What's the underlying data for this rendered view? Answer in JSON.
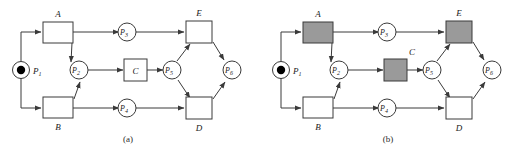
{
  "figure": {
    "type": "petri-net-diagram",
    "panels": [
      {
        "id": "a",
        "caption": "(a)",
        "description": "Petri net with all transitions unshaded",
        "places": [
          {
            "name": "P1",
            "base": "P",
            "sub": "1",
            "has_token": true,
            "label_side": "right"
          },
          {
            "name": "P2",
            "base": "P",
            "sub": "2",
            "has_token": false,
            "label_side": "inside"
          },
          {
            "name": "P3",
            "base": "P",
            "sub": "3",
            "has_token": false,
            "label_side": "inside"
          },
          {
            "name": "P4",
            "base": "P",
            "sub": "4",
            "has_token": false,
            "label_side": "inside"
          },
          {
            "name": "P5",
            "base": "P",
            "sub": "5",
            "has_token": false,
            "label_side": "inside"
          },
          {
            "name": "P6",
            "base": "P",
            "sub": "6",
            "has_token": false,
            "label_side": "inside"
          }
        ],
        "transitions": [
          {
            "name": "A",
            "label": "A",
            "shaded": false,
            "label_pos": "above"
          },
          {
            "name": "B",
            "label": "B",
            "shaded": false,
            "label_pos": "below"
          },
          {
            "name": "C",
            "label": "C",
            "shaded": false,
            "label_pos": "inside"
          },
          {
            "name": "D",
            "label": "D",
            "shaded": false,
            "label_pos": "below"
          },
          {
            "name": "E",
            "label": "E",
            "shaded": false,
            "label_pos": "above"
          }
        ],
        "arcs": [
          {
            "from": "P1",
            "to": "A"
          },
          {
            "from": "P1",
            "to": "B"
          },
          {
            "from": "A",
            "to": "P3"
          },
          {
            "from": "A",
            "to": "P2"
          },
          {
            "from": "B",
            "to": "P2"
          },
          {
            "from": "B",
            "to": "P4"
          },
          {
            "from": "P2",
            "to": "C"
          },
          {
            "from": "C",
            "to": "P5"
          },
          {
            "from": "P3",
            "to": "E"
          },
          {
            "from": "P5",
            "to": "E"
          },
          {
            "from": "P5",
            "to": "D"
          },
          {
            "from": "P4",
            "to": "D"
          },
          {
            "from": "E",
            "to": "P6"
          },
          {
            "from": "D",
            "to": "P6"
          }
        ]
      },
      {
        "id": "b",
        "caption": "(b)",
        "description": "Petri net with transitions A, C and E shaded grey",
        "places": [
          {
            "name": "P1",
            "base": "P",
            "sub": "1",
            "has_token": true,
            "label_side": "right"
          },
          {
            "name": "P2",
            "base": "P",
            "sub": "2",
            "has_token": false,
            "label_side": "inside"
          },
          {
            "name": "P3",
            "base": "P",
            "sub": "3",
            "has_token": false,
            "label_side": "inside"
          },
          {
            "name": "P4",
            "base": "P",
            "sub": "4",
            "has_token": false,
            "label_side": "inside"
          },
          {
            "name": "P5",
            "base": "P",
            "sub": "5",
            "has_token": false,
            "label_side": "inside"
          },
          {
            "name": "P6",
            "base": "P",
            "sub": "6",
            "has_token": false,
            "label_side": "inside"
          }
        ],
        "transitions": [
          {
            "name": "A",
            "label": "A",
            "shaded": true,
            "label_pos": "above"
          },
          {
            "name": "B",
            "label": "B",
            "shaded": false,
            "label_pos": "below"
          },
          {
            "name": "C",
            "label": "C",
            "shaded": true,
            "label_pos": "above-right"
          },
          {
            "name": "D",
            "label": "D",
            "shaded": false,
            "label_pos": "below"
          },
          {
            "name": "E",
            "label": "E",
            "shaded": true,
            "label_pos": "above"
          }
        ],
        "arcs": [
          {
            "from": "P1",
            "to": "A"
          },
          {
            "from": "P1",
            "to": "B"
          },
          {
            "from": "A",
            "to": "P3"
          },
          {
            "from": "A",
            "to": "P2"
          },
          {
            "from": "B",
            "to": "P2"
          },
          {
            "from": "B",
            "to": "P4"
          },
          {
            "from": "P2",
            "to": "C"
          },
          {
            "from": "C",
            "to": "P5"
          },
          {
            "from": "P3",
            "to": "E"
          },
          {
            "from": "P5",
            "to": "E"
          },
          {
            "from": "P5",
            "to": "D"
          },
          {
            "from": "P4",
            "to": "D"
          },
          {
            "from": "E",
            "to": "P6"
          },
          {
            "from": "D",
            "to": "P6"
          }
        ]
      }
    ]
  },
  "colors": {
    "stroke": "#3a3a3a",
    "shaded_fill": "#9a9a9a",
    "plain_fill": "#ffffff",
    "token_fill": "#000000",
    "background": "#ffffff",
    "text": "#1a1a1a"
  },
  "labels": {
    "panel_a": {
      "A": "A",
      "B": "B",
      "C": "C",
      "D": "D",
      "E": "E",
      "P1_base": "P",
      "P1_sub": "1",
      "P2_base": "P",
      "P2_sub": "2",
      "P3_base": "P",
      "P3_sub": "3",
      "P4_base": "P",
      "P4_sub": "4",
      "P5_base": "P",
      "P5_sub": "5",
      "P6_base": "P",
      "P6_sub": "6",
      "caption": "(a)"
    },
    "panel_b": {
      "A": "A",
      "B": "B",
      "C": "C",
      "D": "D",
      "E": "E",
      "P1_base": "P",
      "P1_sub": "1",
      "P2_base": "P",
      "P2_sub": "2",
      "P3_base": "P",
      "P3_sub": "3",
      "P4_base": "P",
      "P4_sub": "4",
      "P5_base": "P",
      "P5_sub": "5",
      "P6_base": "P",
      "P6_sub": "6",
      "caption": "(b)"
    }
  }
}
